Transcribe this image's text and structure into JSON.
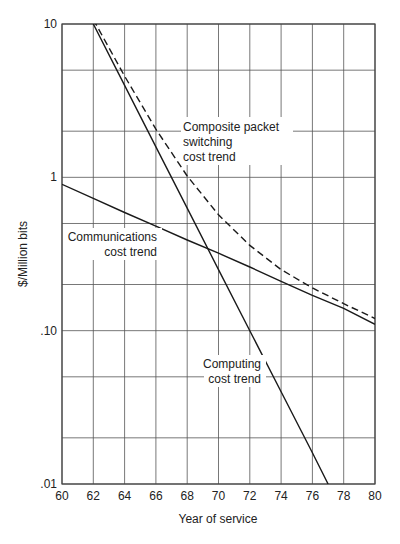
{
  "chart_data": {
    "type": "line",
    "title": "",
    "xlabel": "Year of service",
    "ylabel": "$/Million bits",
    "yscale": "log",
    "xlim": [
      60,
      80
    ],
    "ylim": [
      0.01,
      10
    ],
    "grid": true,
    "x_ticks": [
      60,
      62,
      64,
      66,
      68,
      70,
      72,
      74,
      76,
      78,
      80
    ],
    "x_tick_labels": [
      "60",
      "62",
      "64",
      "66",
      "68",
      "70",
      "72",
      "74",
      "76",
      "78",
      "80"
    ],
    "y_ticks": [
      0.01,
      0.1,
      1,
      10
    ],
    "y_tick_labels": [
      ".01",
      ".10",
      "1",
      "10"
    ],
    "y_minor_gridlines": [
      0.02,
      0.05,
      0.2,
      0.5,
      2,
      5
    ],
    "series": [
      {
        "name": "Computing cost trend",
        "style": "solid",
        "x": [
          62,
          64,
          66,
          68,
          70,
          72,
          74,
          76,
          77
        ],
        "values": [
          10,
          3.98,
          1.58,
          0.63,
          0.25,
          0.1,
          0.04,
          0.016,
          0.01
        ]
      },
      {
        "name": "Communications cost trend",
        "style": "solid",
        "x": [
          60,
          62,
          64,
          66,
          68,
          70,
          72,
          74,
          76,
          78,
          80
        ],
        "values": [
          0.9,
          0.73,
          0.59,
          0.48,
          0.39,
          0.32,
          0.26,
          0.21,
          0.17,
          0.14,
          0.11
        ]
      },
      {
        "name": "Composite packet switching cost trend",
        "style": "dashed",
        "x": [
          62,
          64,
          66,
          68,
          70,
          72,
          74,
          76,
          78,
          80
        ],
        "values": [
          10.7,
          4.57,
          2.06,
          1.02,
          0.57,
          0.36,
          0.25,
          0.19,
          0.15,
          0.12
        ]
      }
    ],
    "annotations": [
      {
        "text": [
          "Composite packet",
          "switching",
          "cost trend"
        ],
        "x": 66.5,
        "y": 2.5
      },
      {
        "text": [
          "Communications",
          "cost trend"
        ],
        "x": 63.5,
        "y": 0.4
      },
      {
        "text": [
          "Computing",
          "cost trend"
        ],
        "x": 71,
        "y": 0.07
      }
    ]
  },
  "labels": {
    "composite": [
      "Composite packet",
      "switching",
      "cost trend"
    ],
    "communications": [
      "Communications",
      "cost trend"
    ],
    "computing": [
      "Computing",
      "cost trend"
    ]
  },
  "colors": {
    "line": "#1a1a1a",
    "grid": "#555555",
    "text": "#222222"
  }
}
